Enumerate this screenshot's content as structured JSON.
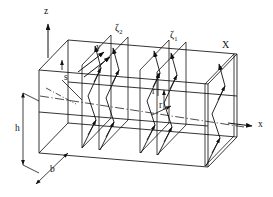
{
  "figure": {
    "background_color": "#ffffff",
    "line_color": "#111111"
  },
  "axes": [
    {
      "name": "z-axis",
      "label": "z",
      "direction": "up",
      "x": 44,
      "y": 14
    },
    {
      "name": "y-axis",
      "label": "y",
      "direction": "up-right",
      "x": 96,
      "y": 50
    },
    {
      "name": "x-axis",
      "label": "x",
      "direction": "right",
      "x": 258,
      "y": 127
    }
  ],
  "dimensions": [
    {
      "name": "height",
      "label": "h",
      "x": 17,
      "y": 128
    },
    {
      "name": "width",
      "label": "b",
      "x": 50,
      "y": 170
    }
  ],
  "section_labels": [
    {
      "name": "zeta-2",
      "base": "ζ",
      "sub": "2",
      "x": 117,
      "y": 31
    },
    {
      "name": "zeta-1",
      "base": "ζ",
      "sub": "1",
      "x": 172,
      "y": 38
    }
  ],
  "point_labels": [
    {
      "name": "arc-length-s",
      "label": "s",
      "x": 62,
      "y": 77
    },
    {
      "name": "radius-r-upper",
      "label": "r",
      "x": 156,
      "y": 93
    },
    {
      "name": "radius-r-lower",
      "label": "r",
      "x": 162,
      "y": 107
    },
    {
      "name": "plane-X",
      "label": "X",
      "x": 225,
      "y": 48
    }
  ],
  "colors": {
    "stroke": "#111111",
    "background": "#ffffff"
  }
}
